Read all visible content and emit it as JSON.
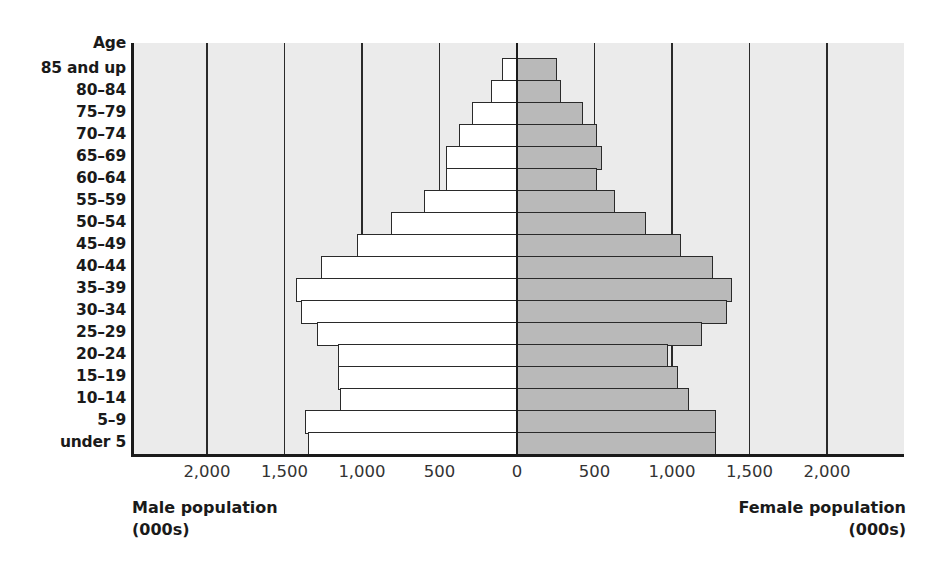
{
  "chart_data": {
    "type": "bar",
    "subtype": "population-pyramid",
    "title": "",
    "y_header": "Age",
    "categories": [
      "85 and up",
      "80–84",
      "75–79",
      "70–74",
      "65–69",
      "60–64",
      "55–59",
      "50–54",
      "45–49",
      "40–44",
      "35–39",
      "30–34",
      "25–29",
      "20–24",
      "15–19",
      "10–14",
      "5–9",
      "under 5"
    ],
    "series": [
      {
        "name": "Male population (000s)",
        "side": "left",
        "color": "#ffffff",
        "values": [
          100,
          170,
          290,
          375,
          460,
          460,
          600,
          810,
          1030,
          1265,
          1425,
          1395,
          1290,
          1155,
          1155,
          1140,
          1370,
          1350
        ]
      },
      {
        "name": "Female population (000s)",
        "side": "right",
        "color": "#b9b9b9",
        "values": [
          260,
          285,
          425,
          515,
          550,
          515,
          630,
          835,
          1060,
          1265,
          1385,
          1355,
          1195,
          975,
          1040,
          1110,
          1285,
          1285
        ]
      }
    ],
    "x_ticks_left": [
      "2,000",
      "1,500",
      "1,000",
      "500",
      "0"
    ],
    "x_ticks_right": [
      "500",
      "1,000",
      "1,500",
      "2,000"
    ],
    "xlabel_left": [
      "Male population",
      "(000s)"
    ],
    "xlabel_right": [
      "Female population",
      "(000s)"
    ],
    "xlim": [
      -2500,
      2500
    ],
    "grid": true,
    "plot_background": "#ebebeb"
  },
  "labels": {
    "age_header": "Age",
    "male_title_line1": "Male population",
    "male_title_line2": "(000s)",
    "female_title_line1": "Female population",
    "female_title_line2": "(000s)"
  }
}
